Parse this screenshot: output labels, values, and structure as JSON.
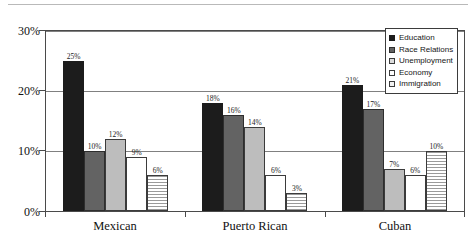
{
  "chart_data": {
    "type": "bar",
    "title": "",
    "xlabel": "",
    "ylabel": "",
    "ylim": [
      0,
      30
    ],
    "yticks": [
      "0%",
      "10%",
      "20%",
      "30%"
    ],
    "ytick_values": [
      0,
      10,
      20,
      30
    ],
    "grid": true,
    "legend_position": "top-right",
    "categories": [
      "Mexican",
      "Puerto Rican",
      "Cuban"
    ],
    "series": [
      {
        "name": "Education",
        "color": "#1c1c1c",
        "values": [
          25,
          18,
          21
        ],
        "labels": [
          "25%",
          "18%",
          "21%"
        ]
      },
      {
        "name": "Race Relations",
        "color": "#636363",
        "values": [
          10,
          16,
          17
        ],
        "labels": [
          "10%",
          "16%",
          "17%"
        ]
      },
      {
        "name": "Unemployment",
        "color": "#bdbdbd",
        "values": [
          12,
          14,
          7
        ],
        "labels": [
          "12%",
          "14%",
          "7%"
        ]
      },
      {
        "name": "Economy",
        "color": "#ffffff",
        "values": [
          9,
          6,
          6
        ],
        "labels": [
          "9%",
          "6%",
          "6%"
        ]
      },
      {
        "name": "Immigration",
        "color": "#ffffff",
        "values": [
          6,
          3,
          10
        ],
        "labels": [
          "6%",
          "3%",
          "10%"
        ]
      }
    ]
  }
}
